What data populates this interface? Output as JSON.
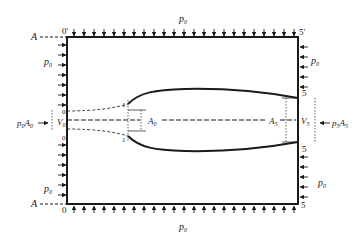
{
  "diagram": {
    "type": "control-volume schematic",
    "labels": {
      "ambient_pressure": "p",
      "ambient_sub": "0",
      "section_A": "A",
      "corner_top_left": "0'",
      "corner_top_right": "5'",
      "corner_bottom_left": "0",
      "corner_bottom_right": "5",
      "inlet_force": "p",
      "inlet_force_sub": "0",
      "inlet_force_A": "A",
      "inlet_force_A_sub": "0",
      "inlet_velocity": "V",
      "inlet_velocity_sub": "0",
      "inlet_upper_mark": "0",
      "inlet_lower_mark": "0",
      "station1_upper": "1",
      "station1_lower": "1",
      "area_inlet": "A",
      "area_inlet_sub": "0",
      "area_exit": "A",
      "area_exit_sub": "5",
      "exit_velocity": "V",
      "exit_velocity_sub": "5",
      "exit_force": "p",
      "exit_force_sub": "5",
      "exit_force_A": "A",
      "exit_force_A_sub": "5",
      "station5_upper": "5",
      "station5_lower": "5"
    },
    "colors": {
      "stroke": "#1a1a1a",
      "background": "#ffffff"
    }
  }
}
